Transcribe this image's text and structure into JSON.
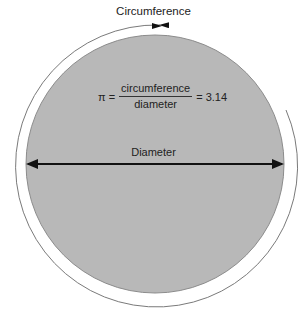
{
  "diagram": {
    "title": "Circumference",
    "formula": {
      "lhs": "π =",
      "numerator": "circumference",
      "denominator": "diameter",
      "rhs": "= 3.14"
    },
    "diameter_label": "Diameter",
    "colors": {
      "circle_fill": "#b8b8b8",
      "circle_stroke": "#8a8a8a",
      "arc_stroke": "#777777",
      "arrow": "#111111"
    }
  }
}
